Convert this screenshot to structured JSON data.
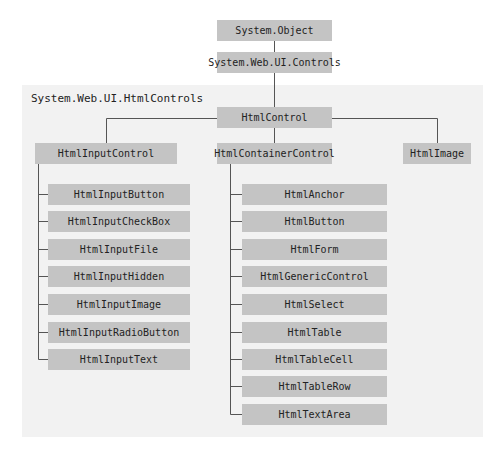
{
  "diagram": {
    "root": {
      "label": "System.Object"
    },
    "controls": {
      "label": "System.Web.UI.Controls"
    },
    "namespace_panel": {
      "label": "System.Web.UI.HtmlControls"
    },
    "html_control": {
      "label": "HtmlControl"
    },
    "branches": {
      "input_control": {
        "label": "HtmlInputControl",
        "children": [
          "HtmlInputButton",
          "HtmlInputCheckBox",
          "HtmlInputFile",
          "HtmlInputHidden",
          "HtmlInputImage",
          "HtmlInputRadioButton",
          "HtmlInputText"
        ]
      },
      "container_control": {
        "label": "HtmlContainerControl",
        "children": [
          "HtmlAnchor",
          "HtmlButton",
          "HtmlForm",
          "HtmlGenericControl",
          "HtmlSelect",
          "HtmlTable",
          "HtmlTableCell",
          "HtmlTableRow",
          "HtmlTextArea"
        ]
      },
      "image": {
        "label": "HtmlImage"
      }
    },
    "colors": {
      "box": "#c4c4c4",
      "panel": "#f2f2f2",
      "line": "#555555",
      "text": "#222222"
    }
  }
}
